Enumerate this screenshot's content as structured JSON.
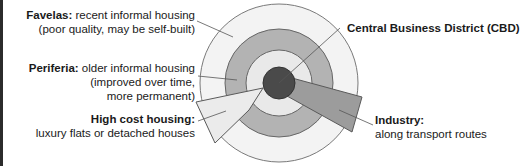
{
  "diagram": {
    "zones": [
      {
        "id": "favelas",
        "name": "Favelas",
        "description_lines": [
          "recent informal housing",
          "(poor quality, may be self-built)"
        ],
        "color": "#f2f2f2"
      },
      {
        "id": "periferia",
        "name": "Periferia",
        "description_lines": [
          "older informal housing",
          "(improved over time,",
          "more permanent)"
        ],
        "color": "#b5b5b5"
      },
      {
        "id": "inner",
        "name": "Inner zone",
        "color": "#e8e8e8"
      },
      {
        "id": "cbd",
        "name": "Central Business District (CBD)",
        "color": "#4a4a4a"
      },
      {
        "id": "high_cost",
        "name": "High cost housing",
        "description_lines": [
          "luxury flats or detached houses"
        ],
        "color": "#eaeaea"
      },
      {
        "id": "industry",
        "name": "Industry",
        "description_lines": [
          "along transport routes"
        ],
        "color": "#9a9a9a"
      }
    ],
    "labels": {
      "favelas_title": "Favelas:",
      "favelas_line1": " recent informal housing",
      "favelas_line2": "(poor quality, may be self-built)",
      "periferia_title": "Periferia:",
      "periferia_line1": " older informal housing",
      "periferia_line2": "(improved over time,",
      "periferia_line3": "more permanent)",
      "highcost_title": "High cost housing:",
      "highcost_line1": "luxury flats or detached houses",
      "cbd_title": "Central Business District (CBD)",
      "industry_title": "Industry:",
      "industry_line1": "along transport routes"
    },
    "colors": {
      "outline": "#6e6e6e",
      "leader": "#555555"
    }
  }
}
